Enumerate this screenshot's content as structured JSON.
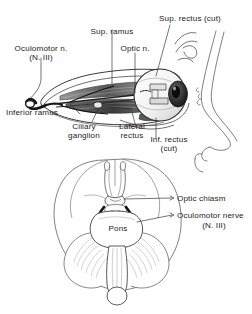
{
  "figure": {
    "background_color": "#ffffff",
    "ink_color": "#1b1b1b",
    "line_color": "#4a4a4a"
  },
  "panels": {
    "orbit": {
      "name": "lateral orbit dissection",
      "labels": {
        "oculomotor_n": "Oculomotor n.",
        "oculomotor_n_sub": "(N. III)",
        "sup_ramus": "Sup. ramus",
        "optic_n": "Optic n.",
        "sup_rectus_cut": "Sup. rectus (cut)",
        "inferior_ramus": "Inferior ramus",
        "ciliary_ganglion_1": "Ciliary",
        "ciliary_ganglion_2": "ganglion",
        "lateral_rectus_1": "Lateral",
        "lateral_rectus_2": "rectus",
        "inf_rectus_1": "Inf. rectus",
        "inf_rectus_2": "(cut)"
      }
    },
    "brainstem": {
      "name": "inferior brain view",
      "labels": {
        "optic_chiasm": "Optic chiasm",
        "oculomotor_nerve": "Oculomotor nerve",
        "oculomotor_nerve_sub": "(N. III)",
        "pons": "Pons"
      }
    }
  }
}
